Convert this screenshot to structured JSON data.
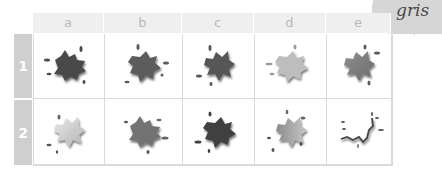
{
  "tag": {
    "label": "gris",
    "color": "#d6d6d6"
  },
  "columns": [
    "a",
    "b",
    "c",
    "d",
    "e"
  ],
  "rows": [
    {
      "label": "1",
      "cells": [
        {
          "col": "a",
          "fill": "#4a4a4a",
          "style": "solid"
        },
        {
          "col": "b",
          "fill": "#5c5c5c",
          "style": "solid"
        },
        {
          "col": "c",
          "fill": "#575757",
          "style": "solid"
        },
        {
          "col": "d",
          "fill": "#bdbdbd",
          "style": "solid"
        },
        {
          "col": "e",
          "fill": "#7a7a7a",
          "style": "gradient"
        }
      ]
    },
    {
      "label": "2",
      "cells": [
        {
          "col": "a",
          "fill": "#c9c9c9",
          "style": "gradient"
        },
        {
          "col": "b",
          "fill": "#737373",
          "style": "solid"
        },
        {
          "col": "c",
          "fill": "#3f3f3f",
          "style": "solid"
        },
        {
          "col": "d",
          "fill": "#8c8c8c",
          "style": "gradient"
        },
        {
          "col": "e",
          "fill": "#ffffff",
          "style": "outline"
        }
      ]
    }
  ],
  "colors": {
    "header_bg": "#efefef",
    "header_text": "#b9b9b9",
    "row_label_bg": "#cfcfcf",
    "grid_line": "#dadada"
  }
}
